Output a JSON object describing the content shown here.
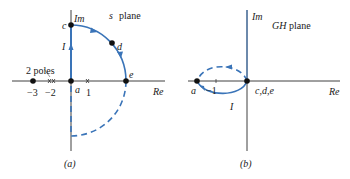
{
  "figure": {
    "panel_a": {
      "caption": "(a)",
      "plane_title_var": "s",
      "plane_title_word": "plane",
      "axis_re": "Re",
      "axis_im": "Im",
      "points": {
        "a": "a",
        "c": "c",
        "d": "d",
        "e": "e"
      },
      "segment_label": "I",
      "ticks": [
        "−3",
        "−2",
        "1"
      ],
      "annotation": "2 poles"
    },
    "panel_b": {
      "caption": "(b)",
      "plane_title_var": "GH",
      "plane_title_word": "plane",
      "axis_re": "Re",
      "axis_im": "Im",
      "point_a": "a",
      "point_origin": "c,d,e",
      "segment_label": "I",
      "tick": "−1"
    },
    "colors": {
      "contour": "#3a74b8",
      "axis": "#2b2b2b",
      "point": "#111111"
    }
  }
}
